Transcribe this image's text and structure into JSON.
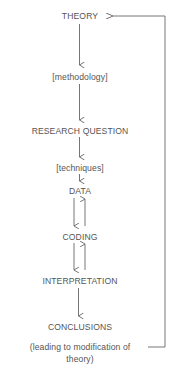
{
  "diagram": {
    "nodes": [
      {
        "id": "theory",
        "label": "THEORY"
      },
      {
        "id": "methodology",
        "label": "[methodology]"
      },
      {
        "id": "research_question",
        "label": "RESEARCH QUESTION"
      },
      {
        "id": "techniques",
        "label": "[techniques]"
      },
      {
        "id": "data",
        "label": "DATA"
      },
      {
        "id": "coding",
        "label": "CODING"
      },
      {
        "id": "interpretation",
        "label": "INTERPRETATION"
      },
      {
        "id": "conclusions",
        "label": "CONCLUSIONS"
      }
    ],
    "feedback_note": {
      "line1": "(leading to modification of",
      "line2": "theory)"
    },
    "edges": [
      {
        "from": "theory",
        "to": "methodology",
        "direction": "down"
      },
      {
        "from": "methodology",
        "to": "research_question",
        "direction": "down"
      },
      {
        "from": "research_question",
        "to": "techniques",
        "direction": "down"
      },
      {
        "from": "techniques",
        "to": "data",
        "direction": "down"
      },
      {
        "from": "data",
        "to": "coding",
        "direction": "down"
      },
      {
        "from": "coding",
        "to": "data",
        "direction": "up"
      },
      {
        "from": "coding",
        "to": "interpretation",
        "direction": "down"
      },
      {
        "from": "interpretation",
        "to": "coding",
        "direction": "up"
      },
      {
        "from": "interpretation",
        "to": "conclusions",
        "direction": "down"
      },
      {
        "from": "conclusions",
        "to": "theory",
        "direction": "feedback-loop"
      }
    ],
    "colors": {
      "text": "#555555",
      "line": "#666666",
      "background": "#ffffff"
    }
  }
}
